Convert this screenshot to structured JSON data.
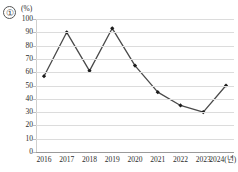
{
  "figure": {
    "item_number": "①",
    "unit_label": "(%)"
  },
  "chart_data": {
    "type": "line",
    "title": "",
    "xlabel": "",
    "ylabel": "",
    "unit": "(%)",
    "categories": [
      "2016",
      "2017",
      "2018",
      "2019",
      "2020",
      "2021",
      "2022",
      "2023",
      "2024(년)"
    ],
    "x_tick_labels": [
      "2016",
      "2017",
      "2018",
      "2019",
      "2020",
      "2021",
      "2022",
      "2023",
      "2024(년)"
    ],
    "values": [
      57,
      90,
      61,
      93,
      65,
      45,
      35,
      30,
      50
    ],
    "ylim": [
      0,
      100
    ],
    "y_tick_labels": [
      "100",
      "90",
      "80",
      "70",
      "60",
      "50",
      "40",
      "30",
      "20",
      "10",
      "0"
    ],
    "y_ticks": [
      100,
      90,
      80,
      70,
      60,
      50,
      40,
      30,
      20,
      10,
      0
    ],
    "grid": true,
    "legend": "none",
    "line_color": "#4a4a4a",
    "marker_color": "#1c1c1c",
    "marker": "diamond"
  }
}
